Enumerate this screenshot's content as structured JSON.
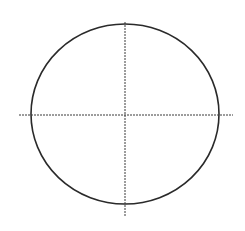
{
  "diagram": {
    "type": "ellipse-with-centerlines",
    "ellipse": {
      "cx": 125,
      "cy": 114,
      "rx": 94,
      "ry": 90,
      "stroke": "#2a2a2a",
      "stroke_width": 1.6
    },
    "centerlines": {
      "horizontal": {
        "x1": 19,
        "x2": 233,
        "y": 115
      },
      "vertical": {
        "x": 125,
        "y1": 22,
        "y2": 217
      },
      "stroke": "#3a3a3a",
      "dash": "2,1"
    }
  }
}
